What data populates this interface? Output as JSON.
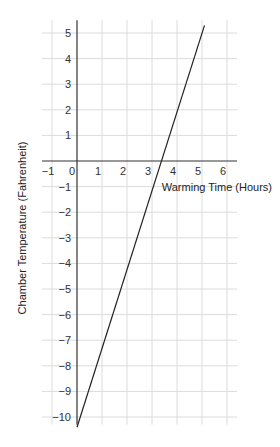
{
  "chart_data": {
    "type": "line",
    "title": "",
    "xlabel": "Warming Time (Hours)",
    "ylabel": "Chamber Temperature (Fahrenheit)",
    "xlim": [
      -1.4,
      6.4
    ],
    "ylim": [
      -10.3,
      5.5
    ],
    "x_ticks": [
      -1,
      0,
      1,
      2,
      3,
      4,
      5,
      6
    ],
    "y_ticks": [
      5,
      4,
      3,
      2,
      1,
      -1,
      -2,
      -3,
      -4,
      -5,
      -6,
      -7,
      -8,
      -9,
      -10
    ],
    "grid": true,
    "series": [
      {
        "name": "temperature",
        "x": [
          0,
          5.1
        ],
        "y": [
          -10.4,
          5.3
        ],
        "color": "#222222"
      }
    ]
  }
}
